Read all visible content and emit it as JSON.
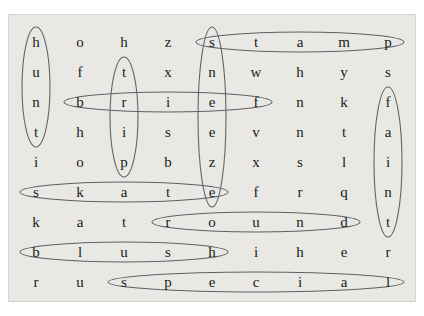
{
  "puzzle": {
    "kind": "word-search",
    "rows": 9,
    "cols": 9,
    "background_color": "#e9e8e4",
    "page_color": "#ffffff",
    "letter_color": "#1b1b1b",
    "ellipse_color": "#5d6066",
    "grid": [
      [
        "h",
        "o",
        "h",
        "z",
        "s",
        "t",
        "a",
        "m",
        "p"
      ],
      [
        "u",
        "f",
        "t",
        "x",
        "n",
        "w",
        "h",
        "y",
        "s"
      ],
      [
        "n",
        "b",
        "r",
        "i",
        "e",
        "f",
        "n",
        "k",
        "f"
      ],
      [
        "t",
        "h",
        "i",
        "s",
        "e",
        "v",
        "n",
        "t",
        "a"
      ],
      [
        "i",
        "o",
        "p",
        "b",
        "z",
        "x",
        "s",
        "l",
        "i"
      ],
      [
        "s",
        "k",
        "a",
        "t",
        "e",
        "f",
        "r",
        "q",
        "n"
      ],
      [
        "k",
        "a",
        "t",
        "r",
        "o",
        "u",
        "n",
        "d",
        "t"
      ],
      [
        "b",
        "l",
        "u",
        "s",
        "h",
        "i",
        "h",
        "e",
        "r"
      ],
      [
        "r",
        "u",
        "s",
        "p",
        "e",
        "c",
        "i",
        "a",
        "l"
      ]
    ],
    "found_words": [
      {
        "word": "hunt",
        "orientation": "vertical",
        "row": 0,
        "col": 0,
        "length": 4
      },
      {
        "word": "trip",
        "orientation": "vertical",
        "row": 1,
        "col": 2,
        "length": 4
      },
      {
        "word": "sneeze",
        "orientation": "vertical",
        "row": 0,
        "col": 4,
        "length": 6
      },
      {
        "word": "faint",
        "orientation": "vertical",
        "row": 2,
        "col": 8,
        "length": 5
      },
      {
        "word": "stamp",
        "orientation": "horizontal",
        "row": 0,
        "col": 4,
        "length": 5
      },
      {
        "word": "brief",
        "orientation": "horizontal",
        "row": 2,
        "col": 1,
        "length": 5
      },
      {
        "word": "skate",
        "orientation": "horizontal",
        "row": 5,
        "col": 0,
        "length": 5
      },
      {
        "word": "round",
        "orientation": "horizontal",
        "row": 6,
        "col": 3,
        "length": 5
      },
      {
        "word": "blush",
        "orientation": "horizontal",
        "row": 7,
        "col": 0,
        "length": 5
      },
      {
        "word": "special",
        "orientation": "horizontal",
        "row": 8,
        "col": 2,
        "length": 7
      }
    ]
  }
}
